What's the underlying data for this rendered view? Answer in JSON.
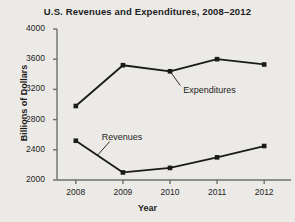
{
  "chart_data": {
    "type": "line",
    "title": "U.S. Revenues and Expenditures, 2008–2012",
    "xlabel": "Year",
    "ylabel": "Billions of Dollars",
    "categories": [
      "2008",
      "2009",
      "2010",
      "2011",
      "2012"
    ],
    "x": [
      2008,
      2009,
      2010,
      2011,
      2012
    ],
    "xticklabels": [
      "2008",
      "2009",
      "2010",
      "2011",
      "2012"
    ],
    "yticklabels": [
      "2000",
      "2400",
      "2800",
      "3200",
      "3600",
      "4000"
    ],
    "yticks": [
      2000,
      2400,
      2800,
      3200,
      3600,
      4000
    ],
    "ylim": [
      2000,
      4000
    ],
    "xlim": [
      2007.6,
      2012.4
    ],
    "grid": false,
    "legend": "none",
    "marker": "square",
    "series": [
      {
        "name": "Expenditures",
        "values": [
          2980,
          3520,
          3440,
          3600,
          3530
        ],
        "color": "#1a1a1a",
        "annotation": {
          "label": "Expenditures",
          "text_x": 2010.28,
          "text_y": 3180,
          "leader_from_x": 2010.0,
          "leader_from_y": 3440,
          "leader_to_x": 2010.22,
          "leader_to_y": 3250
        }
      },
      {
        "name": "Revenues",
        "values": [
          2520,
          2100,
          2160,
          2300,
          2450
        ],
        "color": "#1a1a1a",
        "annotation": {
          "label": "Revenues",
          "text_x": 2008.55,
          "text_y": 2560,
          "leader_from_x": 2008.72,
          "leader_from_y": 2510,
          "leader_to_x": 2008.45,
          "leader_to_y": 2320
        }
      }
    ]
  },
  "style": {
    "background": "#eceae6",
    "axis_color": "#6e6e6e",
    "text_color": "#1d1d1d",
    "line_color": "#1a1a1a"
  }
}
